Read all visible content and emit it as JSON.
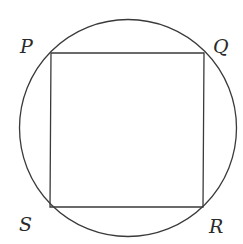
{
  "diagram": {
    "stroke_color": "#3a3a3a",
    "circle": {
      "cx": 128,
      "cy": 128,
      "r": 108.5
    },
    "square": {
      "vertices": {
        "P": [
          51,
          53
        ],
        "Q": [
          204,
          53
        ],
        "R": [
          203,
          207
        ],
        "S": [
          50,
          207
        ]
      }
    },
    "labels": {
      "P": {
        "text": "P",
        "x": 20,
        "y": 53
      },
      "Q": {
        "text": "Q",
        "x": 213,
        "y": 53
      },
      "S": {
        "text": "S",
        "x": 19,
        "y": 231
      },
      "R": {
        "text": "R",
        "x": 209,
        "y": 233
      }
    }
  }
}
